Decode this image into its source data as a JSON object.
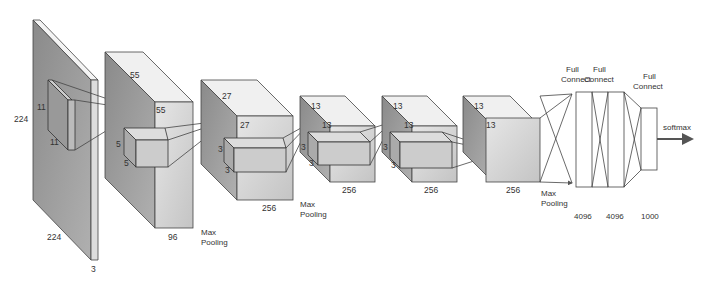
{
  "input": {
    "height": "224",
    "width": "224",
    "depth": "3",
    "kernel_h": "11",
    "kernel_w": "11"
  },
  "conv1": {
    "h": "55",
    "w": "55",
    "depth": "96",
    "kernel_h": "5",
    "kernel_w": "5",
    "pool": [
      "Max",
      "Pooling"
    ]
  },
  "conv2": {
    "h": "27",
    "w": "27",
    "depth": "256",
    "kernel_h": "3",
    "kernel_w": "3",
    "pool": [
      "Max",
      "Pooling"
    ]
  },
  "conv3": {
    "h": "13",
    "w": "13",
    "depth": "256",
    "kernel_h": "3",
    "kernel_w": "3"
  },
  "conv4": {
    "h": "13",
    "w": "13",
    "depth": "256",
    "kernel_h": "3",
    "kernel_w": "3"
  },
  "conv5": {
    "h": "13",
    "w": "13",
    "depth": "256",
    "pool": [
      "Max",
      "Pooling"
    ]
  },
  "fc": [
    {
      "label": [
        "Full",
        "Connect"
      ],
      "size": "4096"
    },
    {
      "label": [
        "Full",
        "Connect"
      ],
      "size": "4096"
    },
    {
      "label": [
        "Full",
        "Connect"
      ],
      "size": "1000"
    }
  ],
  "output": {
    "label": "softmax"
  }
}
